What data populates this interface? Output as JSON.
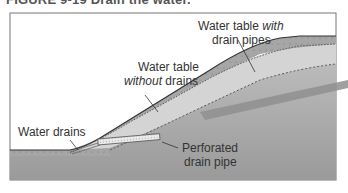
{
  "figure": {
    "caption": "FIGURE 9-19 Drain the water."
  },
  "labels": {
    "wt_with_line1_a": "Water table ",
    "wt_with_line1_b": "with",
    "wt_with_line2": "drain pipes",
    "wt_without_line1": "Water table",
    "wt_without_line2_a": "without",
    "wt_without_line2_b": " drains",
    "water_drains": "Water drains",
    "perforated_line1": "Perforated",
    "perforated_line2": "drain pipe"
  },
  "colors": {
    "frame_border": "#777777",
    "sky": "#ffffff",
    "topsoil": "#a8a8a8",
    "light_band": "#d6d6d6",
    "deep_ground": "#a0a0a0",
    "beam": "#8f8f8f",
    "pipe": "#e8e8e8"
  }
}
